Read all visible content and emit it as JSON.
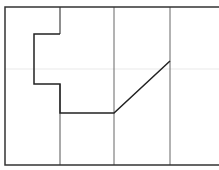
{
  "diagram": {
    "width": 219,
    "height": 170,
    "background": "#ffffff",
    "frame": {
      "x1": 5,
      "y1": 7,
      "x2": 219,
      "y2": 165,
      "color": "#333333",
      "stroke_width": 1.5
    },
    "faint_band": {
      "y": 69,
      "color": "#f0f0f0"
    },
    "vertical_dividers": [
      {
        "x": 60,
        "y1": 84,
        "y2": 165,
        "color": "#555555"
      },
      {
        "x": 114,
        "y1": 7,
        "y2": 165,
        "color": "#666666"
      },
      {
        "x": 170,
        "y1": 7,
        "y2": 165,
        "color": "#666666"
      }
    ],
    "top_step_segment": {
      "points": [
        [
          60,
          7
        ],
        [
          60,
          34
        ]
      ],
      "color": "#444444"
    },
    "path": {
      "points": [
        [
          60,
          34
        ],
        [
          34,
          34
        ],
        [
          34,
          84
        ],
        [
          60,
          84
        ],
        [
          60,
          113
        ],
        [
          114,
          113
        ],
        [
          170,
          61
        ]
      ],
      "color": "#222222",
      "stroke_width": 1.5
    }
  }
}
